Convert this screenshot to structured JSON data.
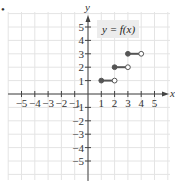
{
  "chart_data": {
    "type": "line",
    "title": "",
    "function_label": "y = f(x)",
    "xlabel": "x",
    "ylabel": "y",
    "xlim": [
      -5.5,
      6
    ],
    "ylim": [
      -6,
      6
    ],
    "x_ticks": [
      -5,
      -4,
      -3,
      -2,
      -1,
      1,
      2,
      3,
      4,
      5
    ],
    "y_ticks": [
      -5,
      -4,
      -3,
      -2,
      -1,
      1,
      2,
      3,
      4,
      5
    ],
    "x_tick_labels": [
      "−5",
      "−4",
      "−3",
      "−2",
      "−1",
      "1",
      "2",
      "3",
      "4",
      "5"
    ],
    "y_tick_labels": [
      "−5",
      "−4",
      "−3",
      "−2",
      "−1",
      "1",
      "2",
      "3",
      "4",
      "5"
    ],
    "grid": true,
    "series": [
      {
        "name": "f(x) step segments",
        "segments": [
          {
            "x_start": 1,
            "x_end": 2,
            "y": 1,
            "start_closed": true,
            "end_closed": false
          },
          {
            "x_start": 2,
            "x_end": 3,
            "y": 2,
            "start_closed": true,
            "end_closed": false
          },
          {
            "x_start": 3,
            "x_end": 4,
            "y": 3,
            "start_closed": true,
            "end_closed": false
          }
        ]
      }
    ]
  },
  "bullet": "•",
  "colors": {
    "grid": "#e4e4e4",
    "axis": "#444444",
    "segment": "#555555",
    "label_bg": "#ececec"
  }
}
